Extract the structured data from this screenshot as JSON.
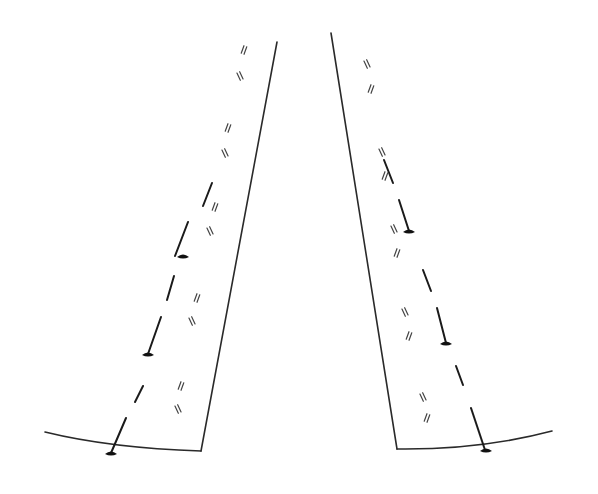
{
  "figure": {
    "colors": {
      "background": "#ffffff",
      "ink": "#1a1a1a",
      "ink_light": "#444444"
    },
    "left_panel": {
      "outer_edge": {
        "x1": 277,
        "y1": 42,
        "x2": 201,
        "y2": 451
      },
      "bottom_arc": {
        "x1": 45,
        "y1": 432,
        "cx": 110,
        "cy": 448,
        "x2": 201,
        "y2": 451
      },
      "nail_line_dashes": [
        [
          212,
          183,
          203,
          206
        ],
        [
          188,
          222,
          175,
          256
        ],
        [
          174,
          276,
          167,
          300
        ],
        [
          161,
          317,
          148,
          354
        ],
        [
          143,
          386,
          135,
          402
        ],
        [
          126,
          418,
          111,
          453
        ]
      ],
      "nails": [
        {
          "x": 183,
          "y": 256
        },
        {
          "x": 148,
          "y": 354
        },
        {
          "x": 111,
          "y": 453
        }
      ],
      "tick_marks": [
        {
          "x": 244,
          "y": 50,
          "angle": 20
        },
        {
          "x": 240,
          "y": 76,
          "angle": -25
        },
        {
          "x": 228,
          "y": 128,
          "angle": 20
        },
        {
          "x": 225,
          "y": 153,
          "angle": -25
        },
        {
          "x": 215,
          "y": 207,
          "angle": 20
        },
        {
          "x": 210,
          "y": 231,
          "angle": -25
        },
        {
          "x": 197,
          "y": 298,
          "angle": 20
        },
        {
          "x": 192,
          "y": 321,
          "angle": -25
        },
        {
          "x": 181,
          "y": 386,
          "angle": 20
        },
        {
          "x": 178,
          "y": 409,
          "angle": -25
        }
      ]
    },
    "right_panel": {
      "outer_edge": {
        "x1": 331,
        "y1": 33,
        "x2": 397,
        "y2": 449
      },
      "bottom_arc": {
        "x1": 397,
        "y1": 449,
        "cx": 480,
        "cy": 450,
        "x2": 552,
        "y2": 431
      },
      "nail_line_dashes": [
        [
          384,
          160,
          393,
          183
        ],
        [
          399,
          200,
          409,
          231
        ],
        [
          423,
          270,
          431,
          291
        ],
        [
          437,
          308,
          446,
          343
        ],
        [
          456,
          366,
          463,
          385
        ],
        [
          471,
          408,
          485,
          450
        ]
      ],
      "nails": [
        {
          "x": 409,
          "y": 231
        },
        {
          "x": 446,
          "y": 343
        },
        {
          "x": 486,
          "y": 450
        }
      ],
      "tick_marks": [
        {
          "x": 367,
          "y": 64,
          "angle": -25
        },
        {
          "x": 371,
          "y": 89,
          "angle": 20
        },
        {
          "x": 382,
          "y": 152,
          "angle": -25
        },
        {
          "x": 385,
          "y": 176,
          "angle": 20
        },
        {
          "x": 394,
          "y": 229,
          "angle": -25
        },
        {
          "x": 397,
          "y": 253,
          "angle": 20
        },
        {
          "x": 405,
          "y": 312,
          "angle": -25
        },
        {
          "x": 409,
          "y": 336,
          "angle": 20
        },
        {
          "x": 423,
          "y": 397,
          "angle": -25
        },
        {
          "x": 427,
          "y": 418,
          "angle": 20
        }
      ]
    }
  }
}
